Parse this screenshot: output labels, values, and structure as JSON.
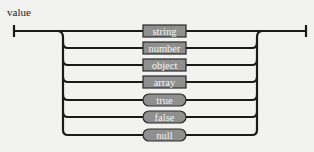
{
  "diagram": {
    "title": "value",
    "type": "railroad",
    "colors": {
      "background": "#f2f2f0",
      "line": "#1a1a1a",
      "node_fill": "#8f8f8f",
      "node_stroke": "#2a2a2a",
      "node_text": "#f4f4f4"
    },
    "alternatives": [
      {
        "label": "string",
        "kind": "nonterminal"
      },
      {
        "label": "number",
        "kind": "nonterminal"
      },
      {
        "label": "object",
        "kind": "nonterminal"
      },
      {
        "label": "array",
        "kind": "nonterminal"
      },
      {
        "label": "true",
        "kind": "terminal"
      },
      {
        "label": "false",
        "kind": "terminal"
      },
      {
        "label": "null",
        "kind": "terminal"
      }
    ]
  }
}
